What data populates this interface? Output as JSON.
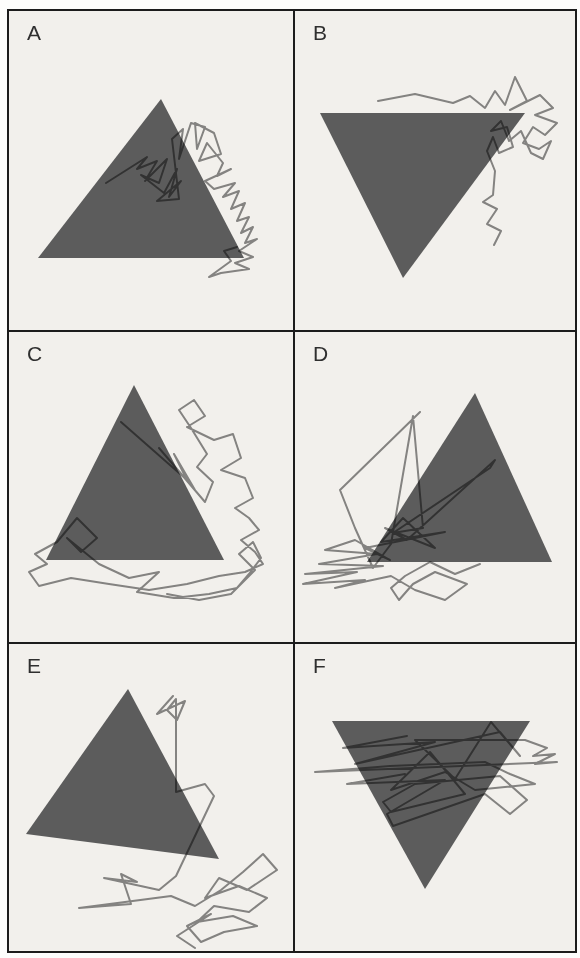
{
  "figure": {
    "colors": {
      "panel_background": "#f2f0ec",
      "frame_border": "#1c1c1c",
      "triangle_fill": "#5c5c5c",
      "trace_stroke": "#8b8b8b",
      "label_color": "#2f2f2f"
    },
    "trace_width": 2,
    "panels": [
      {
        "id": "A",
        "label": "A",
        "triangle": {
          "orientation": "up",
          "points": [
            [
              152,
              88
            ],
            [
              29,
              247
            ],
            [
              235,
              247
            ]
          ]
        },
        "scanpath": {
          "points": [
            [
              97,
              172
            ],
            [
              138,
              146
            ],
            [
              128,
              158
            ],
            [
              148,
              150
            ],
            [
              136,
              170
            ],
            [
              158,
              148
            ],
            [
              150,
              172
            ],
            [
              132,
              164
            ],
            [
              155,
              182
            ],
            [
              168,
              158
            ],
            [
              160,
              186
            ],
            [
              172,
              170
            ],
            [
              148,
              190
            ],
            [
              170,
              188
            ],
            [
              163,
              128
            ],
            [
              174,
              118
            ],
            [
              170,
              148
            ],
            [
              182,
              112
            ],
            [
              196,
              116
            ],
            [
              188,
              138
            ],
            [
              186,
              112
            ],
            [
              205,
              122
            ],
            [
              212,
              143
            ],
            [
              190,
              150
            ],
            [
              198,
              132
            ],
            [
              214,
              152
            ],
            [
              208,
              165
            ],
            [
              222,
              158
            ],
            [
              196,
              170
            ],
            [
              205,
              178
            ],
            [
              226,
              172
            ],
            [
              214,
              186
            ],
            [
              230,
              180
            ],
            [
              222,
              198
            ],
            [
              236,
              192
            ],
            [
              228,
              210
            ],
            [
              240,
              206
            ],
            [
              232,
              222
            ],
            [
              244,
              216
            ],
            [
              236,
              232
            ],
            [
              248,
              228
            ],
            [
              230,
              240
            ],
            [
              244,
              246
            ],
            [
              226,
              252
            ],
            [
              240,
              258
            ],
            [
              212,
              262
            ],
            [
              200,
              266
            ],
            [
              222,
              250
            ],
            [
              215,
              240
            ],
            [
              228,
              236
            ]
          ]
        }
      },
      {
        "id": "B",
        "label": "B",
        "triangle": {
          "orientation": "down",
          "points": [
            [
              25,
              102
            ],
            [
              230,
              102
            ],
            [
              108,
              267
            ]
          ]
        },
        "scanpath": {
          "points": [
            [
              83,
              90
            ],
            [
              120,
              83
            ],
            [
              158,
              92
            ],
            [
              175,
              85
            ],
            [
              190,
              97
            ],
            [
              200,
              80
            ],
            [
              210,
              94
            ],
            [
              220,
              66
            ],
            [
              232,
              90
            ],
            [
              215,
              99
            ],
            [
              245,
              84
            ],
            [
              258,
              97
            ],
            [
              240,
              104
            ],
            [
              262,
              112
            ],
            [
              250,
              124
            ],
            [
              238,
              116
            ],
            [
              228,
              132
            ],
            [
              244,
              138
            ],
            [
              256,
              130
            ],
            [
              248,
              148
            ],
            [
              236,
              142
            ],
            [
              226,
              120
            ],
            [
              214,
              130
            ],
            [
              206,
              110
            ],
            [
              196,
              120
            ],
            [
              212,
              116
            ],
            [
              218,
              136
            ],
            [
              204,
              142
            ],
            [
              198,
              126
            ],
            [
              192,
              140
            ],
            [
              200,
              160
            ],
            [
              198,
              184
            ],
            [
              188,
              191
            ],
            [
              202,
              198
            ],
            [
              192,
              213
            ],
            [
              206,
              220
            ],
            [
              199,
              234
            ]
          ]
        }
      },
      {
        "id": "C",
        "label": "C",
        "triangle": {
          "orientation": "up",
          "points": [
            [
              125,
              53
            ],
            [
              37,
              228
            ],
            [
              215,
              228
            ]
          ]
        },
        "scanpath": {
          "points": [
            [
              112,
              90
            ],
            [
              178,
              148
            ],
            [
              165,
              122
            ],
            [
              186,
              158
            ],
            [
              150,
              116
            ],
            [
              196,
              170
            ],
            [
              204,
              150
            ],
            [
              188,
              135
            ],
            [
              198,
              122
            ],
            [
              182,
              96
            ],
            [
              170,
              78
            ],
            [
              185,
              68
            ],
            [
              196,
              84
            ],
            [
              178,
              95
            ],
            [
              205,
              108
            ],
            [
              224,
              102
            ],
            [
              232,
              126
            ],
            [
              212,
              138
            ],
            [
              236,
              146
            ],
            [
              244,
              166
            ],
            [
              226,
              176
            ],
            [
              240,
              186
            ],
            [
              250,
              198
            ],
            [
              232,
              208
            ],
            [
              246,
              220
            ],
            [
              254,
              232
            ],
            [
              236,
              240
            ],
            [
              210,
              244
            ],
            [
              178,
              252
            ],
            [
              140,
              258
            ],
            [
              100,
              252
            ],
            [
              62,
              246
            ],
            [
              30,
              254
            ],
            [
              20,
              240
            ],
            [
              38,
              232
            ],
            [
              26,
              222
            ],
            [
              48,
              210
            ],
            [
              68,
              186
            ],
            [
              88,
              206
            ],
            [
              72,
              220
            ],
            [
              58,
              206
            ],
            [
              90,
              232
            ],
            [
              120,
              246
            ],
            [
              150,
              240
            ],
            [
              128,
              260
            ],
            [
              165,
              266
            ],
            [
              200,
              262
            ],
            [
              228,
              256
            ],
            [
              240,
              242
            ],
            [
              252,
              226
            ],
            [
              244,
              210
            ],
            [
              230,
              222
            ],
            [
              246,
              238
            ],
            [
              222,
              262
            ],
            [
              190,
              268
            ],
            [
              158,
              262
            ]
          ]
        }
      },
      {
        "id": "D",
        "label": "D",
        "triangle": {
          "orientation": "up",
          "points": [
            [
              180,
              61
            ],
            [
              72,
              230
            ],
            [
              257,
              230
            ]
          ]
        },
        "scanpath": {
          "points": [
            [
              125,
              80
            ],
            [
              45,
              158
            ],
            [
              60,
              196
            ],
            [
              78,
              236
            ],
            [
              96,
              212
            ],
            [
              118,
              84
            ],
            [
              128,
              196
            ],
            [
              98,
              201
            ],
            [
              195,
              136
            ],
            [
              200,
              128
            ],
            [
              112,
              208
            ],
            [
              90,
              196
            ],
            [
              140,
              216
            ],
            [
              108,
              186
            ],
            [
              86,
              210
            ],
            [
              150,
              200
            ],
            [
              70,
              216
            ],
            [
              95,
              228
            ],
            [
              60,
              208
            ],
            [
              30,
              218
            ],
            [
              82,
              222
            ],
            [
              24,
              232
            ],
            [
              88,
              234
            ],
            [
              10,
              242
            ],
            [
              62,
              240
            ],
            [
              8,
              252
            ],
            [
              70,
              248
            ],
            [
              40,
              256
            ],
            [
              96,
              244
            ],
            [
              120,
              258
            ],
            [
              150,
              268
            ],
            [
              172,
              252
            ],
            [
              140,
              240
            ],
            [
              118,
              252
            ],
            [
              104,
              268
            ],
            [
              96,
              256
            ],
            [
              110,
              244
            ],
            [
              135,
              230
            ],
            [
              160,
              242
            ],
            [
              185,
              232
            ]
          ]
        }
      },
      {
        "id": "E",
        "label": "E",
        "triangle": {
          "orientation": "up",
          "points": [
            [
              119,
              45
            ],
            [
              17,
              190
            ],
            [
              210,
              215
            ]
          ]
        },
        "scanpath": {
          "points": [
            [
              164,
              52
            ],
            [
              148,
              70
            ],
            [
              176,
              57
            ],
            [
              168,
              76
            ],
            [
              158,
              66
            ],
            [
              167,
              55
            ],
            [
              167,
              148
            ],
            [
              196,
              140
            ],
            [
              205,
              152
            ],
            [
              167,
              232
            ],
            [
              150,
              246
            ],
            [
              95,
              234
            ],
            [
              128,
              238
            ],
            [
              112,
              230
            ],
            [
              122,
              260
            ],
            [
              70,
              264
            ],
            [
              162,
              252
            ],
            [
              186,
              262
            ],
            [
              212,
              246
            ],
            [
              234,
              228
            ],
            [
              254,
              210
            ],
            [
              268,
              226
            ],
            [
              238,
              246
            ],
            [
              210,
              234
            ],
            [
              196,
              254
            ],
            [
              230,
              242
            ],
            [
              258,
              254
            ],
            [
              240,
              268
            ],
            [
              205,
              262
            ],
            [
              188,
              278
            ],
            [
              224,
              272
            ],
            [
              248,
              282
            ],
            [
              215,
              288
            ],
            [
              192,
              298
            ],
            [
              178,
              282
            ],
            [
              202,
              270
            ],
            [
              168,
              292
            ],
            [
              186,
              304
            ]
          ]
        }
      },
      {
        "id": "F",
        "label": "F",
        "triangle": {
          "orientation": "down",
          "points": [
            [
              37,
              77
            ],
            [
              235,
              77
            ],
            [
              130,
              245
            ]
          ]
        },
        "scanpath": {
          "points": [
            [
              112,
              92
            ],
            [
              48,
              104
            ],
            [
              140,
              98
            ],
            [
              60,
              120
            ],
            [
              205,
              88
            ],
            [
              225,
              112
            ],
            [
              196,
              78
            ],
            [
              160,
              135
            ],
            [
              120,
              96
            ],
            [
              230,
              96
            ],
            [
              252,
              104
            ],
            [
              238,
              112
            ],
            [
              260,
              110
            ],
            [
              240,
              120
            ],
            [
              262,
              118
            ],
            [
              20,
              128
            ],
            [
              95,
              122
            ],
            [
              190,
              118
            ],
            [
              215,
              130
            ],
            [
              240,
              140
            ],
            [
              180,
              146
            ],
            [
              150,
              128
            ],
            [
              96,
              146
            ],
            [
              135,
              108
            ],
            [
              170,
              150
            ],
            [
              96,
              168
            ],
            [
              88,
              158
            ],
            [
              120,
              140
            ],
            [
              205,
              132
            ],
            [
              232,
              156
            ],
            [
              215,
              170
            ],
            [
              190,
              150
            ],
            [
              98,
              182
            ],
            [
              92,
              170
            ],
            [
              150,
              136
            ],
            [
              52,
              140
            ],
            [
              110,
              130
            ]
          ]
        }
      }
    ]
  }
}
